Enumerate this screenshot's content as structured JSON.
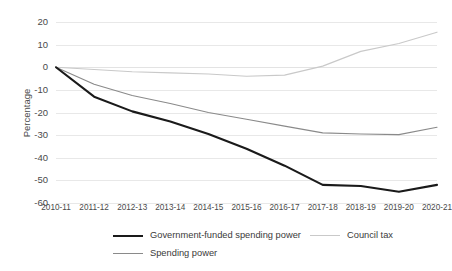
{
  "chart_data": {
    "type": "line",
    "title": "",
    "xlabel": "",
    "ylabel": "Percentage",
    "ylim": [
      -60,
      20
    ],
    "yticks": [
      20,
      10,
      0,
      -10,
      -20,
      -30,
      -40,
      -50,
      -60
    ],
    "ytick_labels": [
      "20",
      "10",
      "0",
      "-10",
      "-20",
      "-30",
      "-40",
      "-50",
      "-60"
    ],
    "grid": true,
    "legend_position": "bottom",
    "categories": [
      "2010-11",
      "2011-12",
      "2012-13",
      "2013-14",
      "2014-15",
      "2015-16",
      "2016-17",
      "2017-18",
      "2018-19",
      "2019-20",
      "2020-21"
    ],
    "series": [
      {
        "name": "Government-funded spending power",
        "color": "#1a1a1a",
        "width": 2.1,
        "values": [
          0,
          -13,
          -19.5,
          -24,
          -29.5,
          -36,
          -43.5,
          -52,
          -52.5,
          -55,
          -52
        ]
      },
      {
        "name": "Council tax",
        "color": "#c9c9c9",
        "width": 1.15,
        "values": [
          0,
          -1,
          -2,
          -2.5,
          -3,
          -4,
          -3.5,
          0.5,
          7,
          10.5,
          15.5
        ]
      },
      {
        "name": "Spending power",
        "color": "#8a8a8a",
        "width": 1.15,
        "values": [
          0,
          -7.5,
          -12.5,
          -16,
          -20,
          -23,
          -26,
          -29,
          -29.5,
          -29.8,
          -26.5
        ]
      }
    ],
    "legend": [
      {
        "label": "Government-funded spending power",
        "series": 0
      },
      {
        "label": "Council tax",
        "series": 1
      },
      {
        "label": "Spending power",
        "series": 2
      }
    ]
  }
}
